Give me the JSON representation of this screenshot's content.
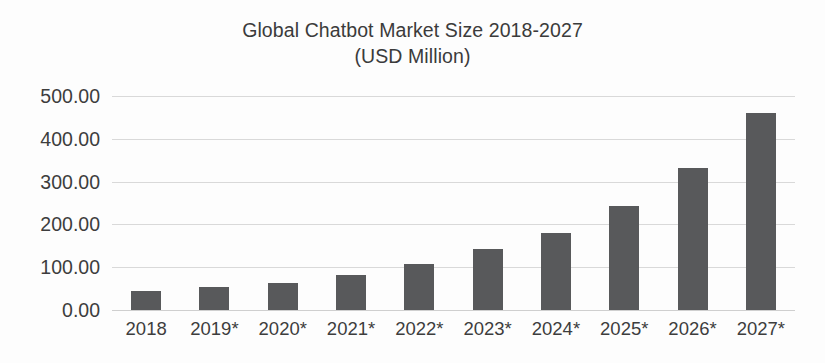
{
  "chart_data": {
    "type": "bar",
    "title": "Global Chatbot Market Size 2018-2027",
    "subtitle": "(USD Million)",
    "title_lines": [
      "Global Chatbot Market Size 2018-2027",
      "(USD Million)"
    ],
    "xlabel": "",
    "ylabel": "",
    "categories": [
      "2018",
      "2019*",
      "2020*",
      "2021*",
      "2022*",
      "2023*",
      "2024*",
      "2025*",
      "2026*",
      "2027*"
    ],
    "values": [
      45,
      54,
      64,
      82,
      108,
      143,
      181,
      242,
      332,
      461
    ],
    "ylim": [
      0,
      500
    ],
    "y_tick_values": [
      0,
      100,
      200,
      300,
      400,
      500
    ],
    "y_tick_labels": [
      "0.00",
      "100.00",
      "200.00",
      "300.00",
      "400.00",
      "500.00"
    ],
    "grid": true,
    "legend": false,
    "legend_position": "none",
    "bar_color": "#58595b",
    "gridline_color": "#d9d9d9",
    "text_color": "#3d3d3d",
    "background_color": "#fdfdfd"
  }
}
